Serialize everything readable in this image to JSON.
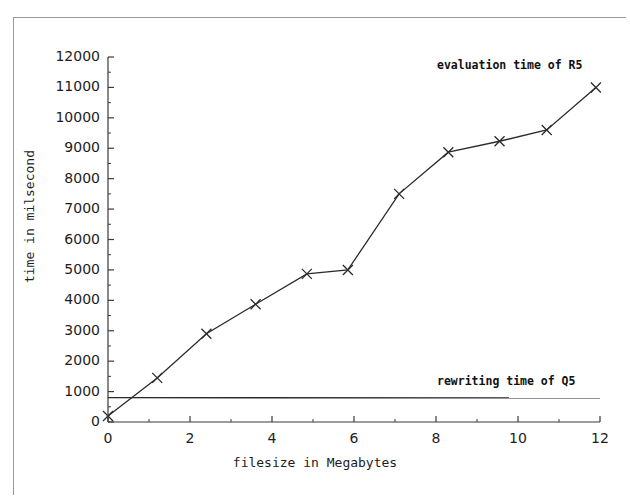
{
  "chart_data": {
    "type": "line",
    "title": "",
    "xlabel": "filesize in Megabytes",
    "ylabel": "time in milsecond",
    "xlim": [
      0,
      12
    ],
    "ylim": [
      0,
      12000
    ],
    "xticks": [
      0,
      2,
      4,
      6,
      8,
      10,
      12
    ],
    "xtick_labels": [
      "0",
      "2",
      "4",
      "6",
      "8",
      "10",
      "12"
    ],
    "yticks": [
      0,
      1000,
      2000,
      3000,
      4000,
      5000,
      6000,
      7000,
      8000,
      9000,
      10000,
      11000,
      12000
    ],
    "ytick_labels": [
      "0",
      "1000",
      "2000",
      "3000",
      "4000",
      "5000",
      "6000",
      "7000",
      "8000",
      "9000",
      "10000",
      "11000",
      "12000"
    ],
    "minor_ytick_step": 500,
    "minor_xtick_step": 0.5,
    "grid": false,
    "legend_position": "inline-annotations",
    "series": [
      {
        "name": "evaluation time of R5",
        "marker": "x",
        "color": "#2b2b2b",
        "x": [
          0.0,
          1.2,
          2.4,
          3.6,
          4.85,
          5.85,
          7.1,
          8.3,
          9.55,
          10.7,
          11.9
        ],
        "y": [
          200,
          1450,
          2900,
          3870,
          4870,
          5000,
          7500,
          8870,
          9230,
          9600,
          11000
        ]
      },
      {
        "name": "rewriting time of Q5",
        "marker": "none",
        "color": "#2b2b2b",
        "x": [
          0.0,
          12.0
        ],
        "y": [
          800,
          790
        ]
      }
    ],
    "annotations": [
      {
        "text": "evaluation time of R5",
        "x": 8.0,
        "y": 11500
      },
      {
        "text": "rewriting time of Q5",
        "x": 8.0,
        "y": 1300
      }
    ]
  },
  "axis": {
    "xlabel": "filesize in Megabytes",
    "ylabel": "time in milsecond"
  },
  "annotations": {
    "evaluation": "evaluation time of R5",
    "rewriting": "rewriting time of Q5"
  },
  "colors": {
    "line": "#2b2b2b",
    "axis": "#3a3a3a",
    "frame": "#9a9a9a",
    "background": "#ffffff"
  }
}
